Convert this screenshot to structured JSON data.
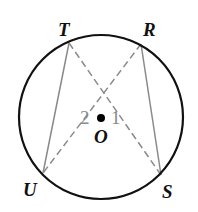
{
  "diagram": {
    "type": "circle-geometry",
    "circle": {
      "center": "O",
      "cx": 101,
      "cy": 117,
      "r": 82,
      "stroke": "#111111"
    },
    "points": {
      "T": {
        "label": "T",
        "x": 69,
        "y": 43
      },
      "R": {
        "label": "R",
        "x": 141,
        "y": 44
      },
      "U": {
        "label": "U",
        "x": 43,
        "y": 173
      },
      "S": {
        "label": "S",
        "x": 161,
        "y": 175
      },
      "O": {
        "label": "O",
        "x": 101,
        "y": 118
      }
    },
    "segments": [
      {
        "from": "T",
        "to": "U",
        "style": "solid",
        "color": "#8a8a8a"
      },
      {
        "from": "R",
        "to": "S",
        "style": "solid",
        "color": "#8a8a8a"
      },
      {
        "from": "T",
        "to": "S",
        "style": "dashed",
        "color": "#8a8a8a"
      },
      {
        "from": "R",
        "to": "U",
        "style": "dashed",
        "color": "#8a8a8a"
      }
    ],
    "angle_labels": {
      "angle1": "1",
      "angle2": "2"
    }
  }
}
